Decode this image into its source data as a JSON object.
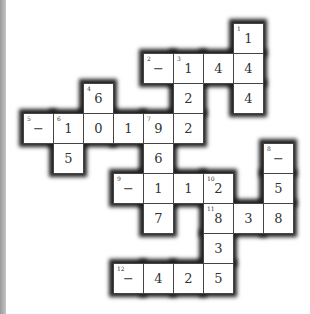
{
  "puzzle": {
    "type": "cross-number",
    "origin": [
      23,
      23
    ],
    "cell_size": 30,
    "cells": [
      {
        "r": 0,
        "c": 7,
        "v": "1",
        "n": "1"
      },
      {
        "r": 1,
        "c": 4,
        "v": "−",
        "n": "2"
      },
      {
        "r": 1,
        "c": 5,
        "v": "1",
        "n": "3"
      },
      {
        "r": 1,
        "c": 6,
        "v": "4",
        "n": ""
      },
      {
        "r": 1,
        "c": 7,
        "v": "4",
        "n": ""
      },
      {
        "r": 2,
        "c": 2,
        "v": "6",
        "n": "4"
      },
      {
        "r": 2,
        "c": 5,
        "v": "2",
        "n": ""
      },
      {
        "r": 2,
        "c": 7,
        "v": "4",
        "n": ""
      },
      {
        "r": 3,
        "c": 0,
        "v": "−",
        "n": "5"
      },
      {
        "r": 3,
        "c": 1,
        "v": "1",
        "n": "6"
      },
      {
        "r": 3,
        "c": 2,
        "v": "0",
        "n": ""
      },
      {
        "r": 3,
        "c": 3,
        "v": "1",
        "n": ""
      },
      {
        "r": 3,
        "c": 4,
        "v": "9",
        "n": "7"
      },
      {
        "r": 3,
        "c": 5,
        "v": "2",
        "n": ""
      },
      {
        "r": 4,
        "c": 1,
        "v": "5",
        "n": ""
      },
      {
        "r": 4,
        "c": 4,
        "v": "6",
        "n": ""
      },
      {
        "r": 4,
        "c": 8,
        "v": "−",
        "n": "8"
      },
      {
        "r": 5,
        "c": 3,
        "v": "−",
        "n": "9"
      },
      {
        "r": 5,
        "c": 4,
        "v": "1",
        "n": ""
      },
      {
        "r": 5,
        "c": 5,
        "v": "1",
        "n": ""
      },
      {
        "r": 5,
        "c": 6,
        "v": "2",
        "n": "10"
      },
      {
        "r": 5,
        "c": 8,
        "v": "5",
        "n": ""
      },
      {
        "r": 6,
        "c": 4,
        "v": "7",
        "n": ""
      },
      {
        "r": 6,
        "c": 6,
        "v": "8",
        "n": "11"
      },
      {
        "r": 6,
        "c": 7,
        "v": "3",
        "n": ""
      },
      {
        "r": 6,
        "c": 8,
        "v": "8",
        "n": ""
      },
      {
        "r": 7,
        "c": 6,
        "v": "3",
        "n": ""
      },
      {
        "r": 8,
        "c": 3,
        "v": "−",
        "n": "12"
      },
      {
        "r": 8,
        "c": 4,
        "v": "4",
        "n": ""
      },
      {
        "r": 8,
        "c": 5,
        "v": "2",
        "n": ""
      },
      {
        "r": 8,
        "c": 6,
        "v": "5",
        "n": ""
      }
    ]
  }
}
